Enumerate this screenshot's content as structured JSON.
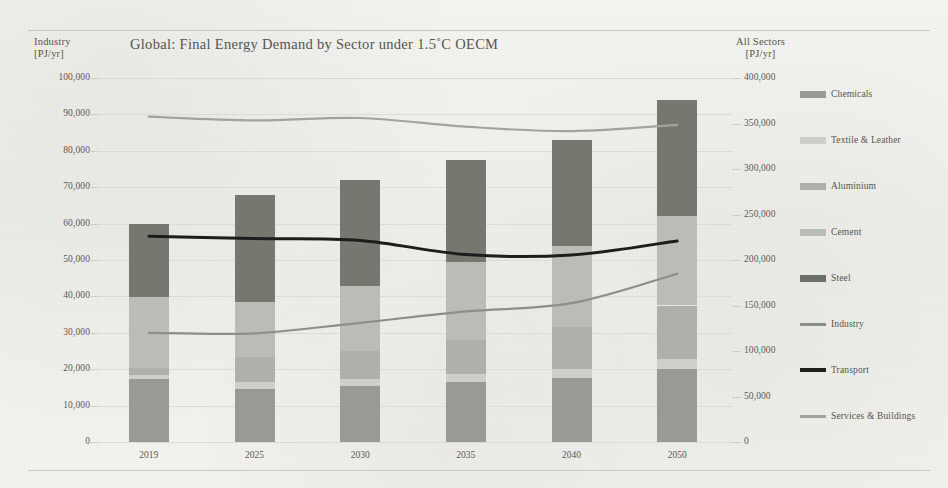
{
  "chart_data": {
    "type": "bar",
    "title": "Global: Final Energy Demand by Sector under 1.5˚C OECM",
    "categories": [
      "2019",
      "2025",
      "2030",
      "2035",
      "2040",
      "2050"
    ],
    "xlabel": "",
    "left_axis": {
      "label": "Industry",
      "unit": "[PJ/yr]",
      "ylim": [
        0,
        100000
      ],
      "ticks": [
        "0",
        "10,000",
        "20,000",
        "30,000",
        "40,000",
        "50,000",
        "60,000",
        "70,000",
        "80,000",
        "90,000",
        "100,000"
      ],
      "tick_values": [
        0,
        10000,
        20000,
        30000,
        40000,
        50000,
        60000,
        70000,
        80000,
        90000,
        100000
      ]
    },
    "right_axis": {
      "label": "All Sectors",
      "unit": "[PJ/yr]",
      "ylim": [
        0,
        400000
      ],
      "ticks": [
        "0",
        "50,000",
        "100,000",
        "150,000",
        "200,000",
        "250,000",
        "300,000",
        "350,000",
        "400,000"
      ],
      "tick_values": [
        0,
        50000,
        100000,
        150000,
        200000,
        250000,
        300000,
        350000,
        400000
      ]
    },
    "grid": true,
    "legend_position": "right",
    "stacked_series": [
      {
        "name": "Chemicals",
        "color": "#9a9994",
        "axis": "left",
        "values": [
          17300,
          14500,
          15300,
          16400,
          17600,
          20100
        ]
      },
      {
        "name": "Textile & Leather",
        "color": "#cfcec9",
        "axis": "left",
        "values": [
          1000,
          2000,
          2000,
          2300,
          2500,
          2800
        ]
      },
      {
        "name": "Aluminium",
        "color": "#b0afaa",
        "axis": "left",
        "values": [
          2000,
          6800,
          7700,
          9300,
          11500,
          14600
        ]
      },
      {
        "name": "Cement",
        "color": "#bcbbb6",
        "axis": "left",
        "values": [
          19500,
          15300,
          17800,
          21400,
          22300,
          24500
        ]
      },
      {
        "name": "Steel",
        "color": "#77766f",
        "axis": "left",
        "values": [
          20200,
          29400,
          29200,
          28200,
          29100,
          32000
        ]
      }
    ],
    "line_series": [
      {
        "name": "Industry",
        "color": "#8e8d87",
        "axis": "right",
        "width": 2.2,
        "values": [
          120000,
          119500,
          131000,
          143500,
          152500,
          185000
        ]
      },
      {
        "name": "Transport",
        "color": "#1d1d1b",
        "axis": "right",
        "width": 3.0,
        "values": [
          226000,
          223500,
          221500,
          206000,
          205500,
          221000
        ]
      },
      {
        "name": "Services & Buildings",
        "color": "#a3a29c",
        "axis": "right",
        "width": 2.2,
        "values": [
          357500,
          353500,
          356000,
          346500,
          341500,
          348500
        ]
      }
    ],
    "bar_totals": [
      60000,
      68000,
      72000,
      77600,
      83000,
      94000
    ]
  },
  "legend": {
    "items": [
      {
        "label": "Chemicals",
        "kind": "bar",
        "color": "#9a9994"
      },
      {
        "label": "Textile & Leather",
        "kind": "bar",
        "color": "#cfcec9"
      },
      {
        "label": "Aluminium",
        "kind": "bar",
        "color": "#b0afaa"
      },
      {
        "label": "Cement",
        "kind": "bar",
        "color": "#bcbbb6"
      },
      {
        "label": "Steel",
        "kind": "bar",
        "color": "#6f6e68"
      },
      {
        "label": "Industry",
        "kind": "line",
        "color": "#8e8d87"
      },
      {
        "label": "Transport",
        "kind": "line",
        "color": "#1d1d1b"
      },
      {
        "label": "Services & Buildings",
        "kind": "line",
        "color": "#a3a29c"
      }
    ]
  },
  "colors": {
    "paper": "#f2f1ee",
    "grid": "#dcdbd6",
    "text": "#55544f",
    "rule": "#c9c8c4"
  }
}
